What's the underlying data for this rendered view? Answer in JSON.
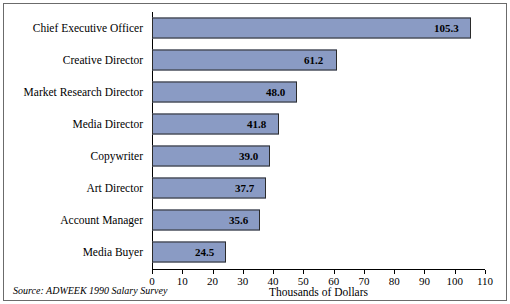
{
  "chart_data": {
    "type": "bar",
    "orientation": "horizontal",
    "title": "",
    "xlabel": "Thousands of Dollars",
    "ylabel": "",
    "xlim": [
      0,
      110
    ],
    "xticks": [
      0,
      10,
      20,
      30,
      40,
      50,
      60,
      70,
      80,
      90,
      100,
      110
    ],
    "grid": false,
    "legend": null,
    "categories": [
      "Chief Executive Officer",
      "Creative Director",
      "Market Research Director",
      "Media Director",
      "Copywriter",
      "Art Director",
      "Account Manager",
      "Media Buyer"
    ],
    "values": [
      105.3,
      61.2,
      48.0,
      41.8,
      39.0,
      37.7,
      35.6,
      24.5
    ],
    "value_labels": [
      "105.3",
      "61.2",
      "48.0",
      "41.8",
      "39.0",
      "37.7",
      "35.6",
      "24.5"
    ],
    "bar_color": "#8a9bc4",
    "bar_border_color": "#2b2b2b",
    "source_note": "Source: ADWEEK 1990 Salary Survey"
  }
}
